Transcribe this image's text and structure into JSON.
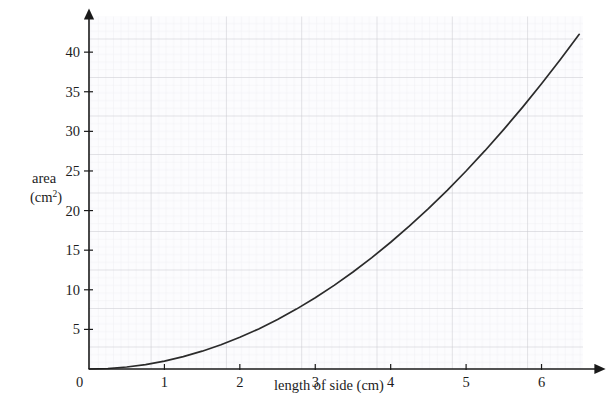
{
  "chart_data": {
    "type": "line",
    "title": "",
    "xlabel": "length of side (cm)",
    "ylabel_line1": "area",
    "ylabel_line2_pre": "(cm",
    "ylabel_line2_sup": "2",
    "ylabel_line2_post": ")",
    "xlim": [
      0,
      6.55
    ],
    "ylim": [
      0,
      44.5
    ],
    "xticks": [
      0,
      1,
      2,
      3,
      4,
      5,
      6
    ],
    "xtick_labels": [
      "0",
      "1",
      "2",
      "3",
      "4",
      "5",
      "6"
    ],
    "yticks": [
      0,
      5,
      10,
      15,
      20,
      25,
      30,
      35,
      40
    ],
    "ytick_labels": [
      "0",
      "5",
      "10",
      "15",
      "20",
      "25",
      "30",
      "35",
      "40"
    ],
    "grid": true,
    "grid_minor_spacing_units": 0.1,
    "grid_major_spacing_x": 1,
    "grid_major_spacing_y": 5,
    "legend": "none",
    "series": [
      {
        "name": "area = side squared",
        "equation": "y = x^2",
        "color": "#2b2b2b",
        "x": [
          0.0,
          0.25,
          0.5,
          0.75,
          1.0,
          1.25,
          1.5,
          1.75,
          2.0,
          2.25,
          2.5,
          2.75,
          3.0,
          3.25,
          3.5,
          3.75,
          4.0,
          4.25,
          4.5,
          4.75,
          5.0,
          5.25,
          5.5,
          5.75,
          6.0,
          6.25,
          6.5
        ],
        "values": [
          0.0,
          0.06,
          0.25,
          0.56,
          1.0,
          1.56,
          2.25,
          3.06,
          4.0,
          5.06,
          6.25,
          7.56,
          9.0,
          10.56,
          12.25,
          14.06,
          16.0,
          18.06,
          20.25,
          22.56,
          25.0,
          27.56,
          30.25,
          33.06,
          36.0,
          39.06,
          42.25
        ]
      }
    ],
    "colors": {
      "curve": "#2b2b2b",
      "axis": "#1a1a1a",
      "grid_major": "#c9c9cf",
      "grid_minor": "#e8e8ee",
      "grid_fill": "#fbfbfd",
      "background": "#ffffff"
    }
  }
}
